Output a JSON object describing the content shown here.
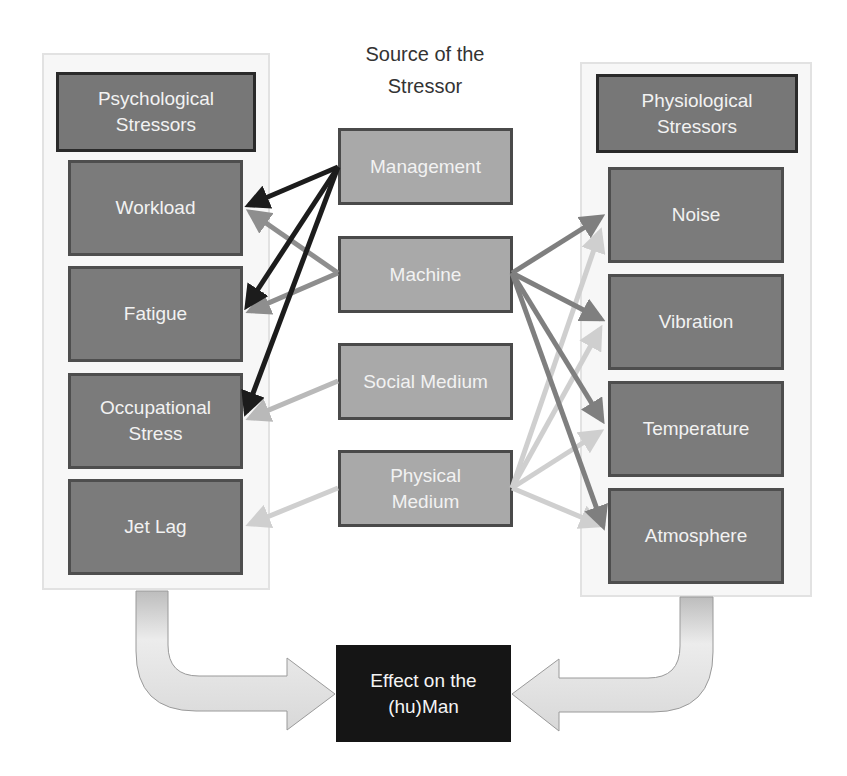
{
  "title": "Source of the\nStressor",
  "left_group": {
    "header": "Psychological\nStressors",
    "items": [
      "Workload",
      "Fatigue",
      "Occupational\nStress",
      "Jet Lag"
    ]
  },
  "sources": [
    "Management",
    "Machine",
    "Social Medium",
    "Physical\nMedium"
  ],
  "right_group": {
    "header": "Physiological\nStressors",
    "items": [
      "Noise",
      "Vibration",
      "Temperature",
      "Atmosphere"
    ]
  },
  "effect": "Effect on the\n(hu)Man",
  "connections": [
    {
      "from": "Management",
      "to": "Workload",
      "color": "#1c1c1c"
    },
    {
      "from": "Management",
      "to": "Fatigue",
      "color": "#1c1c1c"
    },
    {
      "from": "Management",
      "to": "Occupational Stress",
      "color": "#1c1c1c"
    },
    {
      "from": "Machine",
      "to": "Workload",
      "color": "#8e8e8e"
    },
    {
      "from": "Machine",
      "to": "Fatigue",
      "color": "#8e8e8e"
    },
    {
      "from": "Social Medium",
      "to": "Occupational Stress",
      "color": "#b9b9b9"
    },
    {
      "from": "Physical Medium",
      "to": "Jet Lag",
      "color": "#cfcfcf"
    },
    {
      "from": "Machine",
      "to": "Noise",
      "color": "#7f7f7f"
    },
    {
      "from": "Machine",
      "to": "Vibration",
      "color": "#7f7f7f"
    },
    {
      "from": "Machine",
      "to": "Temperature",
      "color": "#7f7f7f"
    },
    {
      "from": "Machine",
      "to": "Atmosphere",
      "color": "#7f7f7f"
    },
    {
      "from": "Physical Medium",
      "to": "Noise",
      "color": "#cfcfcf"
    },
    {
      "from": "Physical Medium",
      "to": "Vibration",
      "color": "#cfcfcf"
    },
    {
      "from": "Physical Medium",
      "to": "Temperature",
      "color": "#cfcfcf"
    },
    {
      "from": "Physical Medium",
      "to": "Atmosphere",
      "color": "#cfcfcf"
    }
  ],
  "colors": {
    "header_fill": "#777777",
    "item_fill": "#7b7b7b",
    "source_fill": "#a9a9a9",
    "effect_fill": "#151515"
  }
}
